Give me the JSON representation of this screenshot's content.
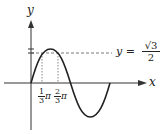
{
  "diagram": {
    "type": "function-graph",
    "function": "y = sin x",
    "axes": {
      "x_label": "x",
      "y_label": "y"
    },
    "reference_line": {
      "equation_lhs": "y =",
      "numerator": "√3",
      "denominator": "2",
      "style": "dashed"
    },
    "x_markers": [
      {
        "num": "1",
        "den": "3",
        "suffix": "π"
      },
      {
        "num": "2",
        "den": "3",
        "suffix": "π"
      }
    ],
    "colors": {
      "curve": "#222222",
      "axes": "#333333",
      "dashed": "#555555"
    }
  }
}
